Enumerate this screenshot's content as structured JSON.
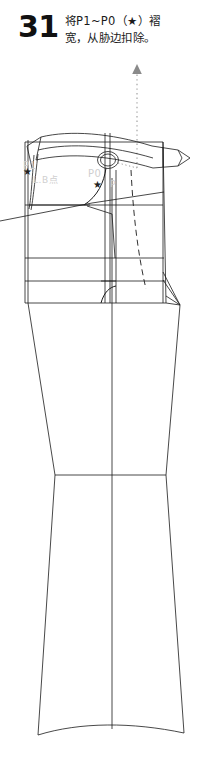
{
  "step": {
    "number": "31",
    "instruction_line1": "将P1~P0（★）褶",
    "instruction_line2": "宽，从胁边扣除。",
    "number_color": "#111111",
    "text_color": "#1a1a1a"
  },
  "annotations": {
    "arrow": {
      "name": "dotted-up-arrow",
      "style": "dotted",
      "direction": "up",
      "color": "#8a8a8a"
    },
    "markers": [
      {
        "name": "star-marker-left",
        "glyph": "★",
        "label": "P1",
        "color": "#222222"
      },
      {
        "name": "star-marker-right",
        "glyph": "★",
        "label": "P0",
        "color": "#222222"
      }
    ],
    "faint_labels": [
      {
        "text": "P1",
        "color": "#cfcfcf"
      },
      {
        "text": "L.B点",
        "color": "#d4d4d4"
      },
      {
        "text": "P0",
        "color": "#cfcfcf"
      },
      {
        "text": "P",
        "color": "#d4d4d4"
      }
    ]
  },
  "drawing": {
    "title": "trouser-pattern-side-view",
    "line_color": "#1a1a1a",
    "line_width": 0.8,
    "fill": "none",
    "dashed_line_color": "#1a1a1a",
    "dotted_leader_color": "#9a9a9a",
    "parts": [
      {
        "name": "waistband",
        "type": "curved-band"
      },
      {
        "name": "belt-tab-point",
        "type": "arrow-tab"
      },
      {
        "name": "button",
        "type": "double-circle"
      },
      {
        "name": "fly-curve",
        "type": "curve"
      },
      {
        "name": "pocket-line",
        "type": "diagonal"
      },
      {
        "name": "hip-dart",
        "type": "wedge"
      },
      {
        "name": "grain-line",
        "type": "vertical"
      },
      {
        "name": "knee-line",
        "type": "horizontal"
      },
      {
        "name": "hem",
        "type": "curve"
      },
      {
        "name": "dashed-crease",
        "type": "dashed-curve"
      }
    ]
  }
}
